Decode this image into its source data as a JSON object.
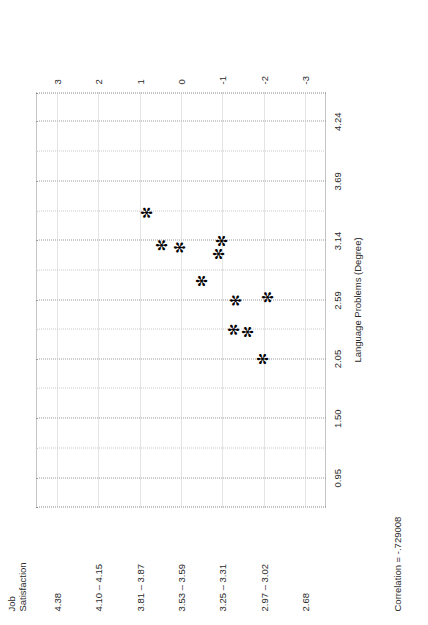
{
  "chart_data": {
    "type": "scatter",
    "title": "",
    "xlabel": "Language Problems (Degree)",
    "ylabel": "Job\nSatisfaction",
    "annotation": "Correlation = -.729008",
    "grid": true,
    "legend": false,
    "x_ticks": [
      "0.95",
      "1.50",
      "2.05",
      "2.59",
      "3.14",
      "3.69",
      "4.24"
    ],
    "x_tick_values": [
      0.95,
      1.5,
      2.05,
      2.59,
      3.14,
      3.69,
      4.24
    ],
    "xlim": [
      0.68,
      4.51
    ],
    "y_ticks": [
      "4.38",
      "4.10 – 4.15",
      "3.81 – 3.87",
      "3.53 – 3.59",
      "3.25 – 3.31",
      "2.97 – 3.02",
      "2.68"
    ],
    "y_tick_values": [
      3,
      2,
      1,
      0,
      -1,
      -2,
      -3
    ],
    "y_secondary_ticks": [
      "3",
      "2",
      "1",
      "0",
      "-1",
      "-2",
      "-3"
    ],
    "ylim": [
      -3.5,
      3.5
    ],
    "points": [
      {
        "x": 2.05,
        "y": -2.0
      },
      {
        "x": 2.32,
        "y": -1.28
      },
      {
        "x": 2.3,
        "y": -1.62
      },
      {
        "x": 2.59,
        "y": -1.35
      },
      {
        "x": 2.62,
        "y": -2.1
      },
      {
        "x": 2.77,
        "y": -0.52
      },
      {
        "x": 3.02,
        "y": -0.92
      },
      {
        "x": 3.1,
        "y": 0.44
      },
      {
        "x": 3.08,
        "y": 0.02
      },
      {
        "x": 3.14,
        "y": -1.0
      },
      {
        "x": 3.4,
        "y": 0.8
      }
    ],
    "marker": "asterisk",
    "marker_color": "#000000"
  }
}
